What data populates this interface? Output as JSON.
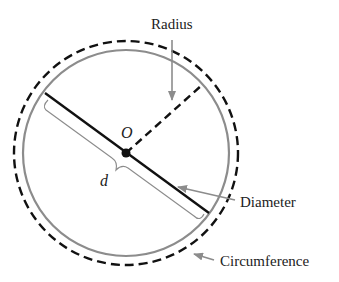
{
  "diagram": {
    "type": "circle-anatomy",
    "center_label": "O",
    "diameter_symbol": "d",
    "labels": {
      "radius": "Radius",
      "diameter": "Diameter",
      "circumference": "Circumference"
    },
    "colors": {
      "background": "#ffffff",
      "circle_stroke": "#8c8c8c",
      "circumference_dashed": "#111111",
      "diameter_line": "#111111",
      "radius_dashed": "#111111",
      "arrow": "#8c8c8c",
      "text": "#222222"
    }
  }
}
